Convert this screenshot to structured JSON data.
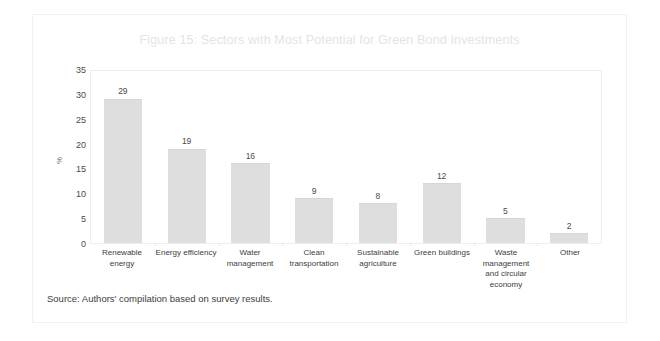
{
  "figure": {
    "title": "Figure 15: Sectors with Most Potential for Green Bond Investments",
    "source_note": "Source: Authors' compilation based on survey results.",
    "title_color": "#e4e4e4",
    "bar_color": "#dedede",
    "text_color": "#3d3d3d",
    "frame_color": "#f1f1f1"
  },
  "chart_data": {
    "type": "bar",
    "title": "Figure 15: Sectors with Most Potential for Green Bond Investments",
    "xlabel": "",
    "ylabel": "%",
    "categories": [
      "Renewable energy",
      "Energy efficiency",
      "Water management",
      "Clean transportation",
      "Sustainable agriculture",
      "Green buildings",
      "Waste management and circular economy",
      "Other"
    ],
    "values": [
      29,
      19,
      16,
      9,
      8,
      12,
      5,
      2
    ],
    "ylim": [
      0,
      35
    ],
    "yticks": [
      0,
      5,
      10,
      15,
      20,
      25,
      30,
      35
    ],
    "ytick_labels": [
      "0",
      "5",
      "10",
      "15",
      "20",
      "25",
      "30",
      "35"
    ],
    "data_labels": [
      "29",
      "19",
      "16",
      "9",
      "8",
      "12",
      "5",
      "2"
    ],
    "grid": false,
    "legend": false
  }
}
